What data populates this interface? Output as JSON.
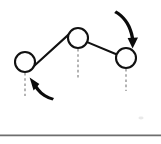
{
  "figure": {
    "background_color": "#ffffff",
    "stroke_color": "#111111",
    "dash_color": "#8d8d8d",
    "arrow_color": "#0b0b0b",
    "divider_color": "#6e6e6e",
    "width": 161,
    "height": 144
  },
  "nodes": [
    {
      "id": "left-node",
      "label": "",
      "cx": 25,
      "cy": 62,
      "r": 10,
      "icon": "open-circle-joint-icon"
    },
    {
      "id": "middle-node",
      "label": "",
      "cx": 78,
      "cy": 38,
      "r": 10,
      "icon": "open-circle-joint-icon"
    },
    {
      "id": "right-node",
      "label": "",
      "cx": 126,
      "cy": 58,
      "r": 10,
      "icon": "open-circle-joint-icon"
    }
  ],
  "links": [
    {
      "id": "link-left-middle",
      "from": "left-node",
      "to": "middle-node",
      "path": "M 34.3 65.7 L 68.8 34.4"
    },
    {
      "id": "link-middle-right",
      "from": "middle-node",
      "to": "right-node",
      "path": "M 87.2 42.1 L 116.3 54.2"
    }
  ],
  "plumb_lines": [
    {
      "id": "plumb-left",
      "node": "left-node",
      "path": "M 25 73 L 25 96"
    },
    {
      "id": "plumb-middle",
      "node": "middle-node",
      "path": "M 78 49 L 78 79"
    },
    {
      "id": "plumb-right",
      "node": "right-node",
      "path": "M 126 69 L 126 91"
    }
  ],
  "arrows": [
    {
      "id": "arrow-top-right",
      "icon": "curved-arrow-down-icon",
      "direction": "clockwise-down",
      "points_to": "right-node",
      "shaft_path": "M 116.2 10.6 C 124.4 14.8 130.6 23.2 133.2 33.6 C 133.8 36.0 134.2 38.4 134.4 40.8 L 131.0 40.6 C 130.8 38.3 130.4 36.0 129.8 33.8 C 127.4 24.4 121.8 16.8 114.2 13.0 Z",
      "head_path": "M 132.6 48.6 L 127.6 38.0 L 138.0 37.4 Z"
    },
    {
      "id": "arrow-bottom-left",
      "icon": "curved-arrow-up-left-icon",
      "direction": "counter-clockwise-up",
      "points_to": "left-node",
      "shaft_path": "M 52.6 100.6 C 46.0 99.2 40.6 95.6 36.6 90.6 C 35.2 88.8 34.0 86.9 33.0 84.9 L 36.0 83.4 C 37.0 85.3 38.1 87.1 39.4 88.8 C 43.1 93.4 48.0 96.7 54.0 98.0 Z",
      "head_path": "M 29.6 77.6 L 39.4 83.9 L 33.6 90.4 Z"
    }
  ],
  "divider": {
    "id": "bottom-divider",
    "path": "M 0 135.4 L 161 135.4"
  },
  "artifacts": [
    {
      "id": "faint-speck",
      "cx": 141,
      "cy": 118,
      "rx": 2.6,
      "ry": 1.4
    }
  ]
}
